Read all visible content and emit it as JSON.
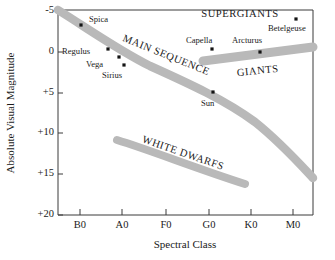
{
  "chart_data": {
    "type": "scatter",
    "title": "",
    "xlabel": "Spectral Class",
    "ylabel": "Absolute Visual Magnitude",
    "grid": false,
    "legend": "none",
    "x_axis": {
      "type": "category",
      "tick_labels": [
        "B0",
        "A0",
        "F0",
        "G0",
        "K0",
        "M0"
      ],
      "tick_positions": [
        80,
        122,
        166,
        209,
        251,
        293
      ],
      "range_px": [
        58,
        313
      ]
    },
    "y_axis": {
      "tick_labels": [
        "-5",
        "0",
        "+5",
        "+10",
        "+15",
        "+20"
      ],
      "tick_values": [
        -5,
        0,
        5,
        10,
        15,
        20
      ],
      "tick_positions": [
        11,
        52,
        93,
        133,
        174,
        215
      ],
      "ylim": [
        -5,
        20
      ],
      "inverted": true
    },
    "points": [
      {
        "name": "Spica",
        "x_px": 81,
        "y_px": 25,
        "spectral": "B1",
        "magnitude": -3.5,
        "label_dx": 8,
        "label_dy": -3
      },
      {
        "name": "Regulus",
        "x_px": 108,
        "y_px": 49,
        "spectral": "B7",
        "magnitude": -0.3,
        "label_dx": -46,
        "label_dy": 5
      },
      {
        "name": "Vega",
        "x_px": 119,
        "y_px": 57,
        "spectral": "A0",
        "magnitude": 0.6,
        "label_dx": -33,
        "label_dy": 10
      },
      {
        "name": "Sirius",
        "x_px": 124,
        "y_px": 65,
        "spectral": "A1",
        "magnitude": 1.5,
        "label_dx": -22,
        "label_dy": 13
      },
      {
        "name": "Sun",
        "x_px": 213,
        "y_px": 92,
        "spectral": "G2",
        "magnitude": 4.8,
        "label_dx": -12,
        "label_dy": 14
      },
      {
        "name": "Capella",
        "x_px": 212,
        "y_px": 49,
        "spectral": "G5",
        "magnitude": -0.5,
        "label_dx": -26,
        "label_dy": -6
      },
      {
        "name": "Arcturus",
        "x_px": 260,
        "y_px": 52,
        "spectral": "K2",
        "magnitude": -0.2,
        "label_dx": -28,
        "label_dy": -9
      },
      {
        "name": "Betelgeuse",
        "x_px": 296,
        "y_px": 19,
        "spectral": "M2",
        "magnitude": -4.3,
        "label_dx": -28,
        "label_dy": 12
      }
    ],
    "regions": [
      {
        "name": "MAIN SEQUENCE",
        "label_x": 165,
        "label_y": 58,
        "label_rotation": 22,
        "band_path": "M 58 10 C 90 30 118 50 150 66 C 190 84 225 100 255 122 C 280 142 298 162 313 178",
        "band_width": 8.5
      },
      {
        "name": "GIANTS",
        "label_x": 258,
        "label_y": 74,
        "label_rotation": -6,
        "band_path": "M 203 61 L 313 47",
        "band_width": 9
      },
      {
        "name": "WHITE DWARFS",
        "label_x": 182,
        "label_y": 156,
        "label_rotation": 19,
        "band_path": "M 117 140 C 150 150 195 168 245 184",
        "band_width": 8
      },
      {
        "name": "SUPERGIANTS",
        "label_x": 240,
        "label_y": 17,
        "label_rotation": 0,
        "band_path": "",
        "band_width": 0
      }
    ],
    "colors": {
      "band": "#b9b9b9",
      "axis": "#3a3a3a",
      "text": "#1a1a1a",
      "dot": "#141414",
      "background": "#ffffff"
    }
  }
}
